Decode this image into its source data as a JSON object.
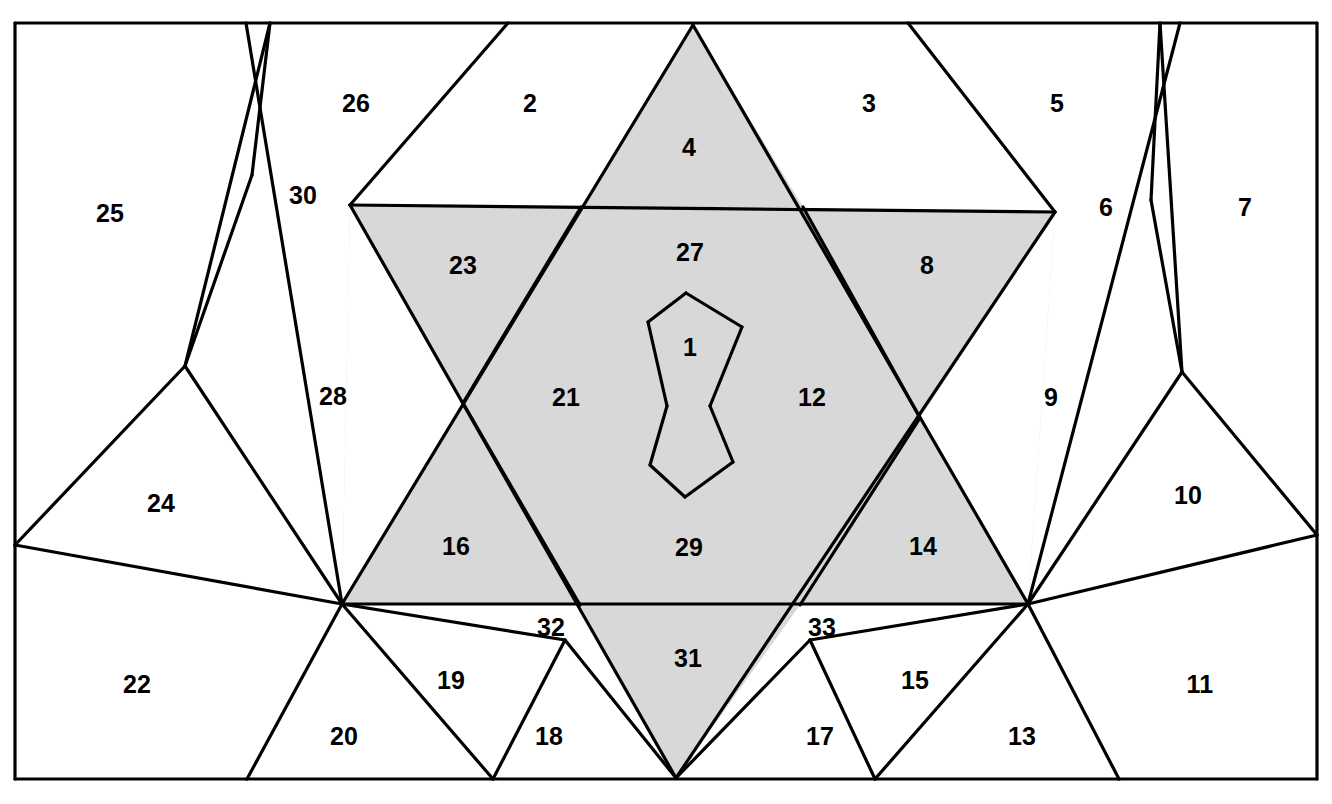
{
  "figure": {
    "type": "geometric-partition-diagram",
    "total_regions": 33,
    "colors": {
      "shaded_fill": "#d8d8d8",
      "plain_fill": "#ffffff",
      "line": "#000000",
      "background": "#ffffff"
    },
    "frame": {
      "x": 15,
      "y": 23,
      "width": 1302,
      "height": 756
    }
  },
  "regions": [
    {
      "id": "1",
      "label": "1",
      "shaded": true,
      "x": 690,
      "y": 347
    },
    {
      "id": "2",
      "label": "2",
      "shaded": false,
      "x": 530,
      "y": 103
    },
    {
      "id": "3",
      "label": "3",
      "shaded": false,
      "x": 869,
      "y": 103
    },
    {
      "id": "4",
      "label": "4",
      "shaded": true,
      "x": 689,
      "y": 147
    },
    {
      "id": "5",
      "label": "5",
      "shaded": false,
      "x": 1057,
      "y": 103
    },
    {
      "id": "6",
      "label": "6",
      "shaded": false,
      "x": 1106,
      "y": 207
    },
    {
      "id": "7",
      "label": "7",
      "shaded": false,
      "x": 1245,
      "y": 207
    },
    {
      "id": "8",
      "label": "8",
      "shaded": true,
      "x": 927,
      "y": 265
    },
    {
      "id": "9",
      "label": "9",
      "shaded": false,
      "x": 1051,
      "y": 397
    },
    {
      "id": "10",
      "label": "10",
      "shaded": false,
      "x": 1188,
      "y": 495
    },
    {
      "id": "11",
      "label": "11",
      "shaded": false,
      "x": 1200,
      "y": 684
    },
    {
      "id": "12",
      "label": "12",
      "shaded": true,
      "x": 812,
      "y": 397
    },
    {
      "id": "13",
      "label": "13",
      "shaded": false,
      "x": 1022,
      "y": 736
    },
    {
      "id": "14",
      "label": "14",
      "shaded": true,
      "x": 923,
      "y": 546
    },
    {
      "id": "15",
      "label": "15",
      "shaded": false,
      "x": 915,
      "y": 680
    },
    {
      "id": "16",
      "label": "16",
      "shaded": true,
      "x": 456,
      "y": 546
    },
    {
      "id": "17",
      "label": "17",
      "shaded": false,
      "x": 820,
      "y": 736
    },
    {
      "id": "18",
      "label": "18",
      "shaded": false,
      "x": 549,
      "y": 736
    },
    {
      "id": "19",
      "label": "19",
      "shaded": false,
      "x": 451,
      "y": 680
    },
    {
      "id": "20",
      "label": "20",
      "shaded": false,
      "x": 344,
      "y": 736
    },
    {
      "id": "21",
      "label": "21",
      "shaded": true,
      "x": 566,
      "y": 397
    },
    {
      "id": "22",
      "label": "22",
      "shaded": false,
      "x": 137,
      "y": 684
    },
    {
      "id": "23",
      "label": "23",
      "shaded": true,
      "x": 463,
      "y": 265
    },
    {
      "id": "24",
      "label": "24",
      "shaded": false,
      "x": 161,
      "y": 503
    },
    {
      "id": "25",
      "label": "25",
      "shaded": false,
      "x": 110,
      "y": 213
    },
    {
      "id": "26",
      "label": "26",
      "shaded": false,
      "x": 356,
      "y": 103
    },
    {
      "id": "27",
      "label": "27",
      "shaded": true,
      "x": 690,
      "y": 252
    },
    {
      "id": "28",
      "label": "28",
      "shaded": false,
      "x": 333,
      "y": 396
    },
    {
      "id": "29",
      "label": "29",
      "shaded": true,
      "x": 689,
      "y": 547
    },
    {
      "id": "30",
      "label": "30",
      "shaded": false,
      "x": 303,
      "y": 195
    },
    {
      "id": "31",
      "label": "31",
      "shaded": true,
      "x": 688,
      "y": 658
    },
    {
      "id": "32",
      "label": "32",
      "shaded": false,
      "x": 551,
      "y": 627
    },
    {
      "id": "33",
      "label": "33",
      "shaded": false,
      "x": 822,
      "y": 627
    }
  ],
  "shaded_polygons": [
    {
      "name": "region-4-triangle",
      "points": "693,25 803,207 581,207"
    },
    {
      "name": "region-31-triangle",
      "points": "676,778 580,605 800,605"
    },
    {
      "name": "star-upper-left-band",
      "points": "350,205 1055,212 1028,604 342,604"
    }
  ],
  "plain_cut_polygons": [
    {
      "name": "cut-left-of-star",
      "points": "350,205 463,403 342,604"
    },
    {
      "name": "cut-right-of-star",
      "points": "1055,212 1028,604 920,418"
    }
  ],
  "edges": [
    {
      "name": "frame-top",
      "points": "15,23 1317,23"
    },
    {
      "name": "frame-right",
      "points": "1317,23 1317,779"
    },
    {
      "name": "frame-bottom",
      "points": "1317,779 15,779"
    },
    {
      "name": "frame-left",
      "points": "15,779 15,23"
    },
    {
      "name": "upper-horizontal-chord",
      "points": "350,205 1055,212"
    },
    {
      "name": "lower-horizontal-chord",
      "points": "342,604 1028,604"
    },
    {
      "name": "star-edge-upleft-down",
      "points": "693,25 342,604"
    },
    {
      "name": "star-edge-upright-down",
      "points": "693,25 1028,604"
    },
    {
      "name": "star-edge-lowleft-up",
      "points": "676,778 350,205"
    },
    {
      "name": "star-edge-lowright-up",
      "points": "676,778 1055,212"
    },
    {
      "name": "inner-v-left-upper",
      "points": "581,207 463,403"
    },
    {
      "name": "inner-v-left-lower",
      "points": "463,403 580,605"
    },
    {
      "name": "inner-v-right-upper",
      "points": "803,207 920,418"
    },
    {
      "name": "inner-v-right-lower",
      "points": "920,418 800,605"
    },
    {
      "name": "center-cell-1-left-upper",
      "points": "648,322 686,293"
    },
    {
      "name": "center-cell-1-top-right",
      "points": "686,293 742,327"
    },
    {
      "name": "center-cell-1-right-down",
      "points": "742,327 710,406"
    },
    {
      "name": "center-cell-1-waist-left",
      "points": "648,322 667,406"
    },
    {
      "name": "center-cell-29-waist-left",
      "points": "667,406 650,465"
    },
    {
      "name": "center-cell-29-bottom-left",
      "points": "650,465 685,497"
    },
    {
      "name": "center-cell-29-bottom-rt",
      "points": "685,497 733,462"
    },
    {
      "name": "center-cell-29-waist-rt",
      "points": "733,462 710,406"
    },
    {
      "name": "topleft-spoke-26-2",
      "points": "508,23 350,205"
    },
    {
      "name": "topleft-spoke-30-26",
      "points": "246,23 342,604"
    },
    {
      "name": "topleft-spoke-25-30",
      "points": "270,23 185,366"
    },
    {
      "name": "left-vertex-to-24",
      "points": "185,366 342,604"
    },
    {
      "name": "left-vertex-to-edge",
      "points": "185,366 15,545"
    },
    {
      "name": "left-lower-chord",
      "points": "15,545 342,604"
    },
    {
      "name": "topright-spoke-3-5",
      "points": "908,23 1055,212"
    },
    {
      "name": "topright-spoke-6-7",
      "points": "1180,23 1028,604"
    },
    {
      "name": "topright-spoke-5-7",
      "points": "1160,23 1182,372"
    },
    {
      "name": "right-vertex-to-9",
      "points": "1182,372 1028,604"
    },
    {
      "name": "right-vertex-to-edge",
      "points": "1182,372 1317,535"
    },
    {
      "name": "right-lower-chord",
      "points": "1317,535 1028,604"
    },
    {
      "name": "bottom-spoke-20-22",
      "points": "342,604 247,779"
    },
    {
      "name": "bottom-spoke-19-20",
      "points": "342,604 493,779"
    },
    {
      "name": "bottom-spoke-32-19",
      "points": "342,604 565,640"
    },
    {
      "name": "bottom-edge-32-18",
      "points": "565,640 493,779"
    },
    {
      "name": "bottom-edge-32-31",
      "points": "565,640 676,778"
    },
    {
      "name": "bottom-spoke-13-11",
      "points": "1028,604 1119,779"
    },
    {
      "name": "bottom-spoke-15-13",
      "points": "1028,604 875,779"
    },
    {
      "name": "bottom-spoke-33-15",
      "points": "1028,604 810,640"
    },
    {
      "name": "bottom-edge-33-17",
      "points": "810,640 875,779"
    },
    {
      "name": "bottom-edge-33-31",
      "points": "810,640 676,778"
    },
    {
      "name": "notch-25-30-upper",
      "points": "270,23 252,175"
    },
    {
      "name": "notch-25-30-lower",
      "points": "252,175 185,366"
    },
    {
      "name": "notch-7-6-upper",
      "points": "1160,23 1151,200"
    },
    {
      "name": "notch-7-6-lower",
      "points": "1151,200 1182,372"
    }
  ]
}
